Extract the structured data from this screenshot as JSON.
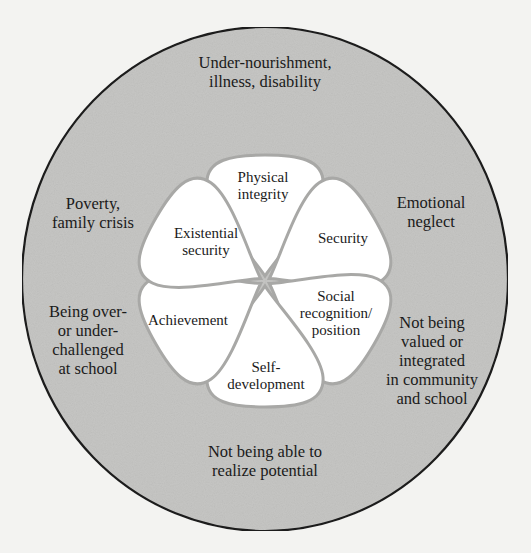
{
  "diagram": {
    "colors": {
      "page_background": "#f3f3f1",
      "outer_ring_fill": "#c6c6c4",
      "outer_ring_stroke": "#1c1c1c",
      "petal_fill": "#ffffff",
      "petal_stroke": "#a8a8a6",
      "text": "#1a1a1a"
    },
    "needs": [
      {
        "id": "physical-integrity",
        "label": "Physical\nintegrity",
        "angle_deg": -90
      },
      {
        "id": "security",
        "label": "Security",
        "angle_deg": -30
      },
      {
        "id": "social-recognition",
        "label": "Social\nrecognition/\nposition",
        "angle_deg": 30
      },
      {
        "id": "self-development",
        "label": "Self-\ndevelopment",
        "angle_deg": 90
      },
      {
        "id": "achievement",
        "label": "Achievement",
        "angle_deg": 150
      },
      {
        "id": "existential-security",
        "label": "Existential\nsecurity",
        "angle_deg": 210
      }
    ],
    "threats": [
      {
        "id": "under-nourishment",
        "label": "Under-nourishment,\nillness, disability"
      },
      {
        "id": "emotional-neglect",
        "label": "Emotional\nneglect"
      },
      {
        "id": "not-valued",
        "label": "Not being\nvalued or\nintegrated\nin community\nand school"
      },
      {
        "id": "not-realize-potential",
        "label": "Not being able to\nrealize potential"
      },
      {
        "id": "over-under-challenged",
        "label": "Being over-\nor under-\nchallenged\nat school"
      },
      {
        "id": "poverty",
        "label": "Poverty,\nfamily crisis"
      }
    ]
  }
}
